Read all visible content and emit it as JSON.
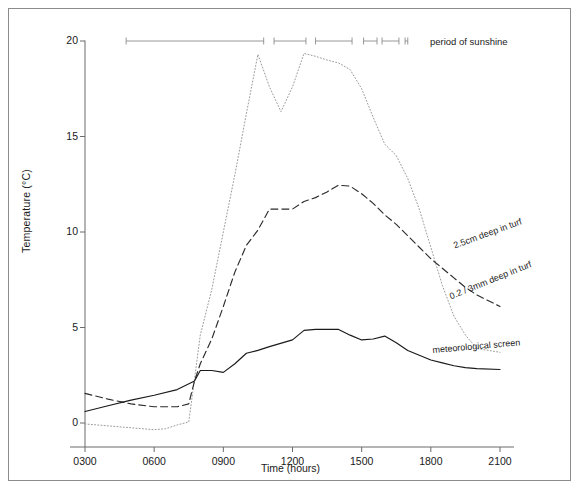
{
  "figure": {
    "border_color": "#8c8c8c",
    "axis_color": "#6b6b6b",
    "text_color": "#1a1a1a"
  },
  "chart_data": {
    "type": "line",
    "title": "",
    "xlabel": "Time (hours)",
    "ylabel": "Temperature (°C)",
    "xlim": [
      300,
      2100
    ],
    "ylim": [
      -1.2,
      20
    ],
    "grid": false,
    "legend_position": "inline-right",
    "xticks": [
      "0300",
      "0600",
      "0900",
      "1200",
      "1500",
      "1800",
      "2100"
    ],
    "xtick_values": [
      300,
      600,
      900,
      1200,
      1500,
      1800,
      2100
    ],
    "yticks": [
      "0",
      "5",
      "10",
      "15",
      "20"
    ],
    "ytick_values": [
      0,
      5,
      10,
      15,
      20
    ],
    "series": [
      {
        "name": "0.2 / 3mm deep in turf",
        "style": "dotted",
        "color": "#9a9a9a",
        "label": "0.2 / 3mm deep in turf",
        "x": [
          300,
          400,
          500,
          600,
          630,
          700,
          730,
          745,
          800,
          830,
          900,
          930,
          1000,
          1030,
          1100,
          1130,
          1200,
          1230,
          1300,
          1330,
          1400,
          1430,
          1500,
          1530,
          1600,
          1630,
          1700,
          1730,
          1800,
          1830,
          1900,
          1930,
          2000,
          2100
        ],
        "y": [
          -0.05,
          -0.15,
          -0.25,
          -0.35,
          -0.3,
          -0.1,
          0.05,
          2.3,
          4.6,
          7.0,
          10.0,
          13.0,
          16.2,
          19.3,
          17.6,
          16.3,
          17.6,
          19.35,
          19.2,
          19.0,
          18.85,
          18.5,
          17.5,
          16.0,
          14.6,
          14.0,
          12.8,
          11.2,
          9.2,
          7.2,
          5.6,
          4.6,
          3.9,
          3.7
        ]
      },
      {
        "name": "2.5cm deep in turf",
        "style": "dashed",
        "color": "#2b2b2b",
        "label": "2.5cm deep in turf",
        "x": [
          300,
          400,
          500,
          600,
          700,
          730,
          745,
          800,
          830,
          900,
          930,
          1000,
          1030,
          1100,
          1130,
          1200,
          1230,
          1300,
          1330,
          1400,
          1430,
          1500,
          1530,
          1600,
          1630,
          1700,
          1730,
          1800,
          1830,
          1900,
          1930,
          2000,
          2100
        ],
        "y": [
          1.55,
          1.25,
          1.0,
          0.85,
          0.85,
          1.0,
          2.2,
          3.1,
          4.4,
          6.1,
          7.9,
          9.3,
          10.1,
          11.2,
          11.2,
          11.2,
          11.6,
          11.8,
          12.1,
          12.45,
          12.4,
          12.0,
          11.5,
          10.9,
          10.4,
          9.8,
          9.2,
          8.6,
          8.1,
          7.6,
          7.1,
          6.7,
          6.1
        ]
      },
      {
        "name": "meteorological screen",
        "style": "solid",
        "color": "#1a1a1a",
        "label": "meteorological screen",
        "x": [
          300,
          400,
          500,
          600,
          700,
          745,
          800,
          830,
          900,
          930,
          1000,
          1030,
          1100,
          1200,
          1230,
          1300,
          1330,
          1400,
          1430,
          1500,
          1530,
          1600,
          1630,
          1700,
          1730,
          1800,
          1830,
          1900,
          1930,
          2000,
          2100
        ],
        "y": [
          0.6,
          0.9,
          1.2,
          1.45,
          1.75,
          2.2,
          2.75,
          2.75,
          2.65,
          3.1,
          3.65,
          3.8,
          4.0,
          4.35,
          4.85,
          4.9,
          4.9,
          4.9,
          4.6,
          4.35,
          4.4,
          4.55,
          4.2,
          3.8,
          3.55,
          3.3,
          3.15,
          3.0,
          2.9,
          2.85,
          2.8
        ]
      }
    ],
    "sunshine": {
      "label": "period of sunshine",
      "level": 20,
      "color": "#8c8c8c",
      "intervals": [
        [
          447,
          1045
        ],
        [
          1112,
          1235
        ],
        [
          1300,
          1435
        ],
        [
          1505,
          1540
        ],
        [
          1553,
          1637
        ],
        [
          1653,
          1700
        ]
      ]
    }
  }
}
